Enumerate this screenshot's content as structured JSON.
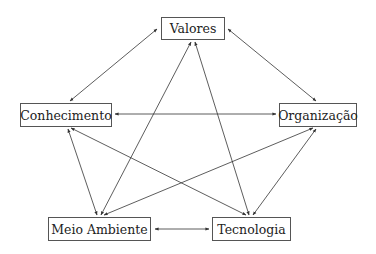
{
  "diagram": {
    "type": "network",
    "nodes": [
      {
        "id": "valores",
        "label": "Valores",
        "x": 161,
        "y": 17,
        "w": 64,
        "h": 23
      },
      {
        "id": "conhecimento",
        "label": "Conhecimento",
        "x": 20,
        "y": 103,
        "w": 92,
        "h": 24
      },
      {
        "id": "organizacao",
        "label": "Organização",
        "x": 279,
        "y": 103,
        "w": 78,
        "h": 24
      },
      {
        "id": "meio_ambiente",
        "label": "Meio Ambiente",
        "x": 48,
        "y": 217,
        "w": 103,
        "h": 24
      },
      {
        "id": "tecnologia",
        "label": "Tecnologia",
        "x": 212,
        "y": 217,
        "w": 79,
        "h": 24
      }
    ],
    "edges": [
      {
        "from": "valores",
        "to": "conhecimento",
        "bidirectional": true,
        "x1": 157,
        "y1": 29,
        "x2": 70,
        "y2": 101
      },
      {
        "from": "valores",
        "to": "organizacao",
        "bidirectional": true,
        "x1": 228,
        "y1": 29,
        "x2": 316,
        "y2": 101
      },
      {
        "from": "conhecimento",
        "to": "organizacao",
        "bidirectional": true,
        "x1": 115,
        "y1": 114,
        "x2": 276,
        "y2": 114
      },
      {
        "from": "valores",
        "to": "meio_ambiente",
        "bidirectional": true,
        "x1": 191,
        "y1": 42,
        "x2": 101,
        "y2": 215
      },
      {
        "from": "valores",
        "to": "tecnologia",
        "bidirectional": true,
        "x1": 195,
        "y1": 42,
        "x2": 249,
        "y2": 215
      },
      {
        "from": "conhecimento",
        "to": "meio_ambiente",
        "bidirectional": true,
        "x1": 68,
        "y1": 129,
        "x2": 97,
        "y2": 215
      },
      {
        "from": "conhecimento",
        "to": "tecnologia",
        "bidirectional": true,
        "x1": 71,
        "y1": 128,
        "x2": 246,
        "y2": 215
      },
      {
        "from": "organizacao",
        "to": "meio_ambiente",
        "bidirectional": true,
        "x1": 313,
        "y1": 128,
        "x2": 104,
        "y2": 215
      },
      {
        "from": "organizacao",
        "to": "tecnologia",
        "bidirectional": true,
        "x1": 316,
        "y1": 129,
        "x2": 253,
        "y2": 215
      },
      {
        "from": "meio_ambiente",
        "to": "tecnologia",
        "bidirectional": true,
        "x1": 155,
        "y1": 229,
        "x2": 209,
        "y2": 229
      }
    ],
    "colors": {
      "line": "#333333",
      "border": "#555555",
      "text": "#222222",
      "background": "#ffffff"
    }
  }
}
